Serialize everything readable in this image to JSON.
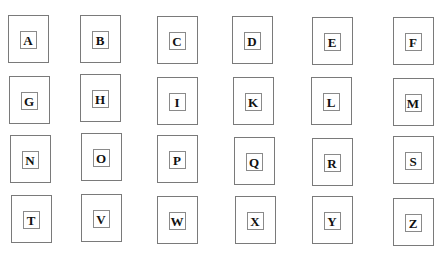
{
  "grid": {
    "rows": [
      {
        "cards": [
          {
            "letter": "A",
            "x": 8,
            "y": 15
          },
          {
            "letter": "B",
            "x": 80,
            "y": 15
          },
          {
            "letter": "C",
            "x": 157,
            "y": 16
          },
          {
            "letter": "D",
            "x": 232,
            "y": 16
          },
          {
            "letter": "E",
            "x": 312,
            "y": 17
          },
          {
            "letter": "F",
            "x": 393,
            "y": 17
          }
        ]
      },
      {
        "cards": [
          {
            "letter": "G",
            "x": 9,
            "y": 76
          },
          {
            "letter": "H",
            "x": 80,
            "y": 74
          },
          {
            "letter": "I",
            "x": 157,
            "y": 77
          },
          {
            "letter": "K",
            "x": 233,
            "y": 77
          },
          {
            "letter": "L",
            "x": 311,
            "y": 77
          },
          {
            "letter": "M",
            "x": 393,
            "y": 78
          }
        ]
      },
      {
        "cards": [
          {
            "letter": "N",
            "x": 10,
            "y": 135
          },
          {
            "letter": "O",
            "x": 81,
            "y": 133
          },
          {
            "letter": "P",
            "x": 157,
            "y": 135
          },
          {
            "letter": "Q",
            "x": 234,
            "y": 137
          },
          {
            "letter": "R",
            "x": 312,
            "y": 138
          },
          {
            "letter": "S",
            "x": 393,
            "y": 136
          }
        ]
      },
      {
        "cards": [
          {
            "letter": "T",
            "x": 11,
            "y": 195
          },
          {
            "letter": "V",
            "x": 81,
            "y": 194
          },
          {
            "letter": "W",
            "x": 157,
            "y": 196
          },
          {
            "letter": "X",
            "x": 235,
            "y": 196
          },
          {
            "letter": "Y",
            "x": 312,
            "y": 196
          },
          {
            "letter": "Z",
            "x": 393,
            "y": 198
          }
        ]
      }
    ]
  }
}
